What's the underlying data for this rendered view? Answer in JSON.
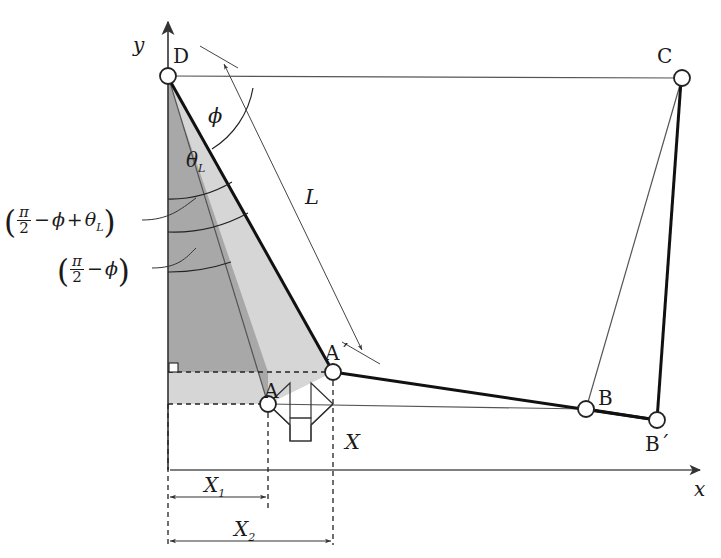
{
  "figure": {
    "type": "geometry-diagram",
    "axes": {
      "x_label": "x",
      "y_label": "y",
      "origin": [
        170,
        470
      ]
    },
    "points": [
      {
        "name": "D",
        "label": "D",
        "x": 168,
        "y": 76
      },
      {
        "name": "C",
        "label": "C",
        "x": 682,
        "y": 78
      },
      {
        "name": "A",
        "label": "A",
        "x": 268,
        "y": 404
      },
      {
        "name": "Aprime",
        "label": "A´",
        "x": 333,
        "y": 372
      },
      {
        "name": "B",
        "label": "B",
        "x": 586,
        "y": 409
      },
      {
        "name": "Bprime",
        "label": "B´",
        "x": 657,
        "y": 420
      }
    ],
    "angles": [
      {
        "name": "phi",
        "label": "ϕ"
      },
      {
        "name": "theta-L",
        "label": "θ",
        "sub": "L"
      }
    ],
    "callouts": [
      {
        "name": "angle-expression-1",
        "parts": [
          "(",
          "π",
          "2",
          "−",
          "ϕ",
          "+",
          "θ",
          "L",
          ")"
        ],
        "text": "(π/2 − ϕ + θ_L)"
      },
      {
        "name": "angle-expression-2",
        "parts": [
          "(",
          "π",
          "2",
          "−",
          "ϕ",
          ")"
        ],
        "text": "(π/2 − ϕ)"
      }
    ],
    "dimensions": [
      {
        "name": "L",
        "label": "L"
      },
      {
        "name": "X",
        "label": "X"
      },
      {
        "name": "X1",
        "label": "X",
        "sub": "1"
      },
      {
        "name": "X2",
        "label": "X",
        "sub": "2"
      }
    ],
    "colors": {
      "stroke": "#1a1a1a",
      "thin": "#555555",
      "dark_fill": "#a8a8a8",
      "light_fill": "#d6d6d6",
      "node_fill": "#ffffff",
      "background": "#ffffff"
    }
  }
}
